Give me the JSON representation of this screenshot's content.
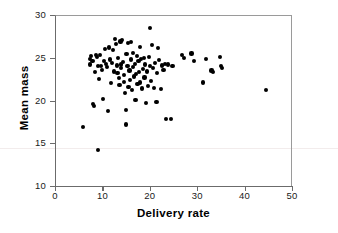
{
  "chart_data": {
    "type": "scatter",
    "title": "",
    "xlabel": "Delivery rate",
    "ylabel": "Mean mass",
    "xlim": [
      0,
      50
    ],
    "ylim": [
      10,
      30
    ],
    "xticks": [
      0,
      10,
      20,
      30,
      40,
      50
    ],
    "yticks": [
      10,
      15,
      20,
      25,
      30
    ],
    "grid": false,
    "legend": false,
    "marker": "filled-circle",
    "marker_color": "#000000",
    "points": [
      [
        5.9,
        16.9
      ],
      [
        7.3,
        24.9
      ],
      [
        7.4,
        24.2
      ],
      [
        7.6,
        25.2
      ],
      [
        7.9,
        24.6
      ],
      [
        8.0,
        19.6
      ],
      [
        8.2,
        19.4
      ],
      [
        8.4,
        23.3
      ],
      [
        8.6,
        25.3
      ],
      [
        8.8,
        25.1
      ],
      [
        9.0,
        14.2
      ],
      [
        9.1,
        24.0
      ],
      [
        9.3,
        22.5
      ],
      [
        9.5,
        25.3
      ],
      [
        9.7,
        24.0
      ],
      [
        9.9,
        23.6
      ],
      [
        10.2,
        20.2
      ],
      [
        10.4,
        24.6
      ],
      [
        10.6,
        26.0
      ],
      [
        10.8,
        24.3
      ],
      [
        11.0,
        23.9
      ],
      [
        11.2,
        18.8
      ],
      [
        11.4,
        26.2
      ],
      [
        11.6,
        24.8
      ],
      [
        11.8,
        22.0
      ],
      [
        12.0,
        24.4
      ],
      [
        12.2,
        25.9
      ],
      [
        12.4,
        23.4
      ],
      [
        12.6,
        27.2
      ],
      [
        12.8,
        26.6
      ],
      [
        13.0,
        24.1
      ],
      [
        13.2,
        23.2
      ],
      [
        13.3,
        25.0
      ],
      [
        13.5,
        22.6
      ],
      [
        13.6,
        21.8
      ],
      [
        13.8,
        26.9
      ],
      [
        13.9,
        24.2
      ],
      [
        14.0,
        23.8
      ],
      [
        14.2,
        27.1
      ],
      [
        14.3,
        24.5
      ],
      [
        14.5,
        22.2
      ],
      [
        14.6,
        23.0
      ],
      [
        14.8,
        20.9
      ],
      [
        14.9,
        18.9
      ],
      [
        15.0,
        17.2
      ],
      [
        15.1,
        25.4
      ],
      [
        15.3,
        24.0
      ],
      [
        15.4,
        26.7
      ],
      [
        15.5,
        21.6
      ],
      [
        15.7,
        23.5
      ],
      [
        15.8,
        22.4
      ],
      [
        16.0,
        24.8
      ],
      [
        16.1,
        26.8
      ],
      [
        16.3,
        21.2
      ],
      [
        16.4,
        23.9
      ],
      [
        16.5,
        25.6
      ],
      [
        16.7,
        22.8
      ],
      [
        16.8,
        24.3
      ],
      [
        17.0,
        20.1
      ],
      [
        17.1,
        23.1
      ],
      [
        17.3,
        25.2
      ],
      [
        17.4,
        21.9
      ],
      [
        17.6,
        24.6
      ],
      [
        17.7,
        23.3
      ],
      [
        17.9,
        26.3
      ],
      [
        18.0,
        22.1
      ],
      [
        18.2,
        24.9
      ],
      [
        18.3,
        21.4
      ],
      [
        18.5,
        23.7
      ],
      [
        18.7,
        25.0
      ],
      [
        18.9,
        22.7
      ],
      [
        19.0,
        24.2
      ],
      [
        19.2,
        19.7
      ],
      [
        19.4,
        23.4
      ],
      [
        19.6,
        21.7
      ],
      [
        19.8,
        25.1
      ],
      [
        20.0,
        28.5
      ],
      [
        20.1,
        24.0
      ],
      [
        20.3,
        22.3
      ],
      [
        20.5,
        26.5
      ],
      [
        20.7,
        23.8
      ],
      [
        20.9,
        21.5
      ],
      [
        21.1,
        24.4
      ],
      [
        21.4,
        19.8
      ],
      [
        21.6,
        23.2
      ],
      [
        21.8,
        26.1
      ],
      [
        22.0,
        24.7
      ],
      [
        22.3,
        21.3
      ],
      [
        22.6,
        24.1
      ],
      [
        22.9,
        23.6
      ],
      [
        23.2,
        24.3
      ],
      [
        23.5,
        17.8
      ],
      [
        23.8,
        24.2
      ],
      [
        24.5,
        17.8
      ],
      [
        24.8,
        24.0
      ],
      [
        26.8,
        25.3
      ],
      [
        27.2,
        25.0
      ],
      [
        28.8,
        25.5
      ],
      [
        29.4,
        24.6
      ],
      [
        31.3,
        22.1
      ],
      [
        31.8,
        24.9
      ],
      [
        33.0,
        23.5
      ],
      [
        33.4,
        23.3
      ],
      [
        34.8,
        25.1
      ],
      [
        35.1,
        24.0
      ],
      [
        35.3,
        23.8
      ],
      [
        44.5,
        21.2
      ]
    ]
  }
}
